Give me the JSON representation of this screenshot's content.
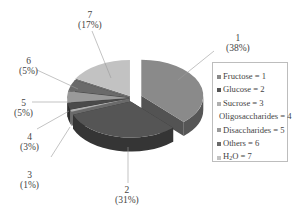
{
  "chart_data": {
    "type": "pie",
    "style": "3d-exploded",
    "title": "",
    "categories": [
      "Fructose",
      "Glucose",
      "Sucrose",
      "Oligosaccharides",
      "Disaccharides",
      "Others",
      "H2O"
    ],
    "codes": [
      1,
      2,
      3,
      4,
      5,
      6,
      7
    ],
    "values": [
      38,
      31,
      1,
      3,
      5,
      5,
      17
    ],
    "unit": "%",
    "legend_position": "right",
    "slice_labels": [
      {
        "code": "1",
        "pct": "(38%)"
      },
      {
        "code": "2",
        "pct": "(31%)"
      },
      {
        "code": "3",
        "pct": "(1%)"
      },
      {
        "code": "4",
        "pct": "(3%)"
      },
      {
        "code": "5",
        "pct": "(5%)"
      },
      {
        "code": "6",
        "pct": "(5%)"
      },
      {
        "code": "7",
        "pct": "(17%)"
      }
    ],
    "colors": [
      "#8a8a8a",
      "#555555",
      "#b0b0b0",
      "#4a4a4a",
      "#9a9a9a",
      "#6a6a6a",
      "#c2c2c2"
    ]
  },
  "legend": {
    "items": [
      {
        "label": "Fructose = 1",
        "color": "#8a8a8a"
      },
      {
        "label": "Glucose = 2",
        "color": "#555555"
      },
      {
        "label": "Sucrose = 3",
        "color": "#b0b0b0"
      },
      {
        "label": "Oligosaccharides = 4",
        "color": "#4a4a4a"
      },
      {
        "label": "Disaccharides = 5",
        "color": "#9a9a9a"
      },
      {
        "label": "Others = 6",
        "color": "#6a6a6a"
      },
      {
        "label_prefix": "H",
        "label_sub": "2",
        "label_suffix": "O = 7",
        "color": "#c2c2c2"
      }
    ]
  }
}
